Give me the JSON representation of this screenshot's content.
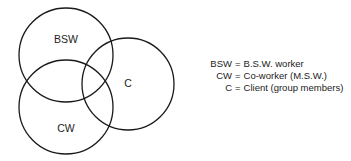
{
  "diagram": {
    "type": "venn",
    "circles": [
      {
        "id": "bsw",
        "label": "BSW",
        "cx": 66,
        "cy": 55,
        "r": 47,
        "label_x": 66,
        "label_y": 43
      },
      {
        "id": "cw",
        "label": "CW",
        "cx": 66,
        "cy": 107,
        "r": 47,
        "label_x": 66,
        "label_y": 132
      },
      {
        "id": "c",
        "label": "C",
        "cx": 128,
        "cy": 84,
        "r": 46,
        "label_x": 128,
        "label_y": 87
      }
    ],
    "stroke_color": "#1a1a1a"
  },
  "legend": {
    "items": [
      {
        "key": "BSW",
        "value": "B.S.W. worker"
      },
      {
        "key": "CW",
        "value": "Co-worker (M.S.W.)"
      },
      {
        "key": "C",
        "value": "Client (group members)"
      }
    ],
    "separator": "="
  }
}
